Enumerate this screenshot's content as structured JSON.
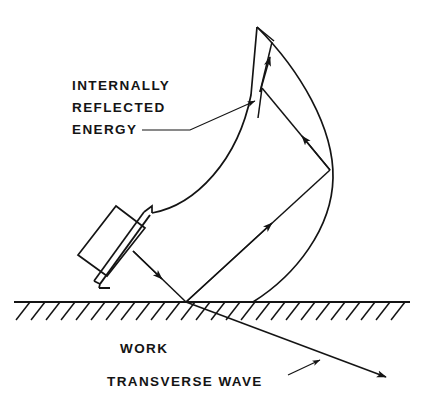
{
  "figure": {
    "background_color": "#ffffff",
    "ink_color": "#141414",
    "labels": {
      "internally": "INTERNALLY",
      "reflected": "REFLECTED",
      "energy": "ENERGY",
      "work": "WORK",
      "transverse_wave": "TRANSVERSE WAVE"
    },
    "elements": {
      "probe_name": "angle-beam-transducer-wedge",
      "surface_name": "work-surface-hatched",
      "beam_envelope_name": "internally-reflected-beam-envelope",
      "incident_ray_name": "incident-beam-ray",
      "transverse_ray_name": "transverse-wave-ray"
    },
    "geometry": {
      "ground_line_y": 302,
      "ground_line_x1": 14,
      "ground_line_x2": 410,
      "hatch_count": 26,
      "hatch_spacing": 15,
      "apex_x": 257,
      "apex_y": 27,
      "entry_point_x": 186,
      "entry_point_y": 302,
      "outer_reflection_x": 330,
      "outer_reflection_y": 170,
      "inner_reflection_x": 262,
      "inner_reflection_y": 88,
      "transverse_end_x": 392,
      "transverse_end_y": 379
    }
  }
}
